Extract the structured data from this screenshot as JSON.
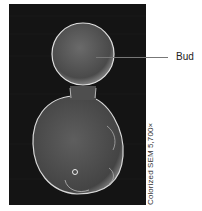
{
  "figure": {
    "label": "Bud",
    "caption": "Colorized SEM 5,700×",
    "colors": {
      "background": "#141414",
      "cell_fill": "#5a5a5a",
      "cell_edge": "#d8d8d8",
      "leader_line": "#777777"
    }
  }
}
